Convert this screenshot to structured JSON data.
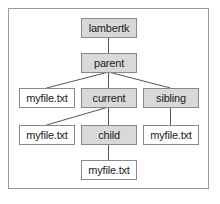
{
  "diagram": {
    "title": "",
    "nodes": [
      {
        "id": "lambertk",
        "label": "lambertk",
        "type": "directory"
      },
      {
        "id": "parent",
        "label": "parent",
        "type": "directory"
      },
      {
        "id": "file1",
        "label": "myfile.txt",
        "type": "file"
      },
      {
        "id": "current",
        "label": "current",
        "type": "directory"
      },
      {
        "id": "sibling",
        "label": "sibling",
        "type": "directory"
      },
      {
        "id": "file2",
        "label": "myfile.txt",
        "type": "file"
      },
      {
        "id": "child",
        "label": "child",
        "type": "directory"
      },
      {
        "id": "file3",
        "label": "myfile.txt",
        "type": "file"
      },
      {
        "id": "file4",
        "label": "myfile.txt",
        "type": "file"
      }
    ],
    "edges": [
      [
        "lambertk",
        "parent"
      ],
      [
        "parent",
        "file1"
      ],
      [
        "parent",
        "current"
      ],
      [
        "parent",
        "sibling"
      ],
      [
        "current",
        "file2"
      ],
      [
        "current",
        "child"
      ],
      [
        "sibling",
        "file3"
      ],
      [
        "child",
        "file4"
      ]
    ],
    "colors": {
      "directory_fill": "#d9d9d9",
      "file_fill": "#ffffff",
      "border": "#8a8a8a",
      "line": "#555555"
    }
  }
}
